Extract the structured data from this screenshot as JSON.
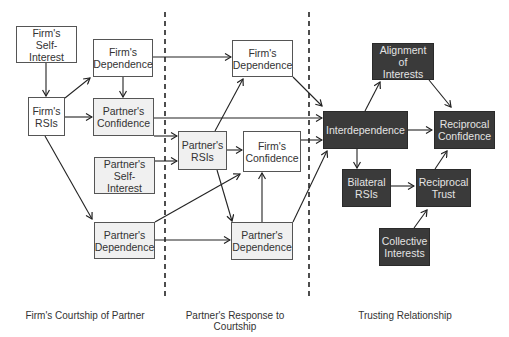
{
  "nodes": {
    "firm_self_interest": "Firm's\nSelf-Interest",
    "firm_rsis": "Firm's\nRSIs",
    "firm_dependence_1": "Firm's\nDependence",
    "partner_confidence": "Partner's\nConfidence",
    "partner_self_interest": "Partner's\nSelf-Interest",
    "partner_dependence_1": "Partner's\nDependence",
    "firm_dependence_2": "Firm's\nDependence",
    "partner_rsis": "Partner's\nRSIs",
    "firm_confidence": "Firm's\nConfidence",
    "partner_dependence_2": "Partner's\nDependence",
    "interdependence": "Interdependence",
    "alignment_of_interests": "Alignment of\nInterests",
    "reciprocal_confidence": "Reciprocal\nConfidence",
    "bilateral_rsis": "Bilateral\nRSIs",
    "reciprocal_trust": "Reciprocal\nTrust",
    "collective_interests": "Collective\nInterests"
  },
  "phases": [
    "Firm's Courtship of Partner",
    "Partner's Response to Courtship",
    "Trusting Relationship"
  ],
  "edges": [
    [
      "firm_self_interest",
      "firm_rsis"
    ],
    [
      "firm_rsis",
      "firm_dependence_1"
    ],
    [
      "firm_rsis",
      "partner_confidence"
    ],
    [
      "firm_rsis",
      "partner_dependence_1"
    ],
    [
      "firm_dependence_1",
      "partner_confidence"
    ],
    [
      "firm_dependence_1",
      "firm_dependence_2"
    ],
    [
      "partner_confidence",
      "interdependence"
    ],
    [
      "partner_confidence",
      "partner_rsis"
    ],
    [
      "partner_self_interest",
      "partner_rsis"
    ],
    [
      "partner_dependence_1",
      "firm_confidence"
    ],
    [
      "partner_dependence_1",
      "partner_dependence_2"
    ],
    [
      "partner_rsis",
      "firm_dependence_2"
    ],
    [
      "partner_rsis",
      "firm_confidence"
    ],
    [
      "partner_rsis",
      "partner_dependence_2"
    ],
    [
      "partner_dependence_2",
      "firm_confidence"
    ],
    [
      "partner_dependence_2",
      "interdependence"
    ],
    [
      "firm_dependence_2",
      "interdependence"
    ],
    [
      "firm_confidence",
      "interdependence"
    ],
    [
      "interdependence",
      "alignment_of_interests"
    ],
    [
      "interdependence",
      "reciprocal_confidence"
    ],
    [
      "interdependence",
      "bilateral_rsis"
    ],
    [
      "alignment_of_interests",
      "reciprocal_confidence"
    ],
    [
      "bilateral_rsis",
      "reciprocal_trust"
    ],
    [
      "reciprocal_trust",
      "reciprocal_confidence"
    ],
    [
      "collective_interests",
      "reciprocal_trust"
    ]
  ]
}
